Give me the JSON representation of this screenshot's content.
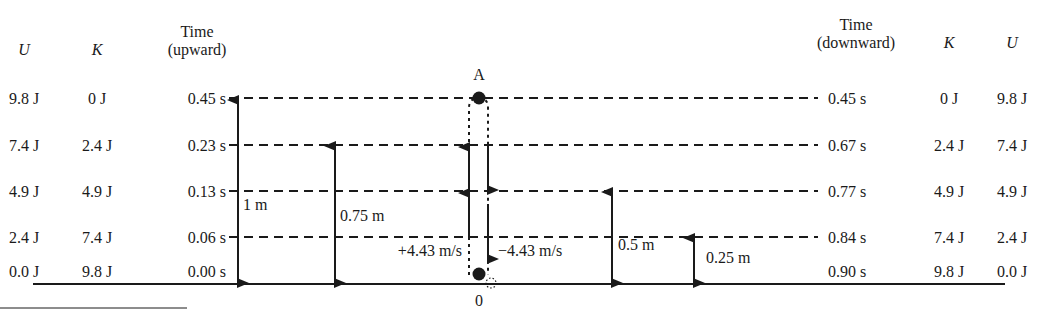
{
  "headers": {
    "left": {
      "U": "U",
      "K": "K",
      "time_line1": "Time",
      "time_line2": "(upward)"
    },
    "right": {
      "time_line1": "Time",
      "time_line2": "(downward)",
      "K": "K",
      "U": "U"
    }
  },
  "rows": [
    {
      "U_left": "9.8 J",
      "K_left": "0 J",
      "t_up": "0.45 s",
      "t_down": "0.45 s",
      "K_right": "0 J",
      "U_right": "9.8 J"
    },
    {
      "U_left": "7.4 J",
      "K_left": "2.4 J",
      "t_up": "0.23 s",
      "t_down": "0.67 s",
      "K_right": "2.4 J",
      "U_right": "7.4 J"
    },
    {
      "U_left": "4.9 J",
      "K_left": "4.9 J",
      "t_up": "0.13 s",
      "t_down": "0.77 s",
      "K_right": "4.9 J",
      "U_right": "4.9 J"
    },
    {
      "U_left": "2.4 J",
      "K_left": "7.4 J",
      "t_up": "0.06 s",
      "t_down": "0.84 s",
      "K_right": "7.4 J",
      "U_right": "2.4 J"
    },
    {
      "U_left": "0.0 J",
      "K_left": "9.8 J",
      "t_up": "0.00 s",
      "t_down": "0.90 s",
      "K_right": "9.8 J",
      "U_right": "0.0 J"
    }
  ],
  "heights": {
    "h1": "1 m",
    "h075": "0.75 m",
    "h05": "0.5 m",
    "h025": "0.25 m"
  },
  "velocities": {
    "up": "+4.43 m/s",
    "down": "−4.43 m/s"
  },
  "points": {
    "top": "A",
    "bottom": "0"
  }
}
